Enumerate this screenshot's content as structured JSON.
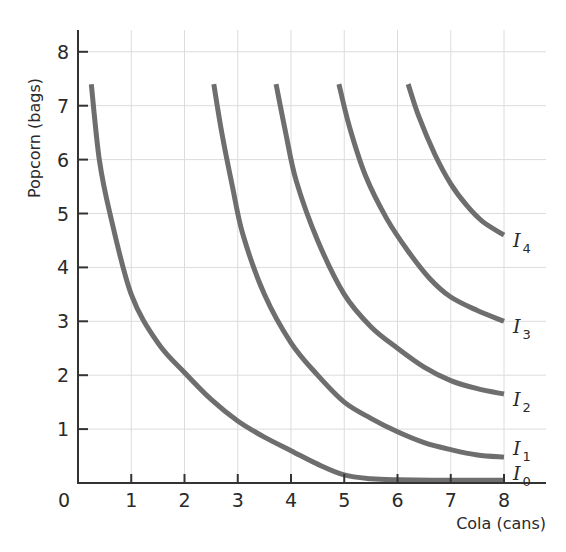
{
  "chart_data": {
    "type": "line",
    "title": "",
    "xlabel": "Cola (cans)",
    "ylabel": "Popcorn (bags)",
    "xlim": [
      0,
      8
    ],
    "ylim": [
      0,
      8
    ],
    "xticks": [
      "0",
      "1",
      "2",
      "3",
      "4",
      "5",
      "6",
      "7",
      "8"
    ],
    "yticks": [
      "1",
      "2",
      "3",
      "4",
      "5",
      "6",
      "7",
      "8"
    ],
    "grid": true,
    "legend": "inline labels at right end of each curve",
    "color": "#6e6e6e",
    "series": [
      {
        "name": "I0",
        "label_main": "I",
        "label_sub": "0",
        "points": [
          [
            0.25,
            7.4
          ],
          [
            0.4,
            6.0
          ],
          [
            0.6,
            5.0
          ],
          [
            1.0,
            3.5
          ],
          [
            1.5,
            2.6
          ],
          [
            2.0,
            2.05
          ],
          [
            2.5,
            1.55
          ],
          [
            3.0,
            1.15
          ],
          [
            3.5,
            0.85
          ],
          [
            4.0,
            0.6
          ],
          [
            4.5,
            0.35
          ],
          [
            5.0,
            0.15
          ],
          [
            5.5,
            0.08
          ],
          [
            6.0,
            0.06
          ],
          [
            7.0,
            0.05
          ],
          [
            8.0,
            0.05
          ]
        ]
      },
      {
        "name": "I1",
        "label_main": "I",
        "label_sub": "1",
        "points": [
          [
            2.55,
            7.4
          ],
          [
            2.7,
            6.5
          ],
          [
            2.9,
            5.5
          ],
          [
            3.1,
            4.6
          ],
          [
            3.5,
            3.5
          ],
          [
            4.0,
            2.6
          ],
          [
            4.5,
            2.0
          ],
          [
            5.0,
            1.5
          ],
          [
            5.5,
            1.2
          ],
          [
            6.0,
            0.95
          ],
          [
            6.5,
            0.75
          ],
          [
            7.0,
            0.62
          ],
          [
            7.5,
            0.52
          ],
          [
            8.0,
            0.48
          ]
        ]
      },
      {
        "name": "I2",
        "label_main": "I",
        "label_sub": "2",
        "points": [
          [
            3.72,
            7.4
          ],
          [
            3.9,
            6.5
          ],
          [
            4.1,
            5.6
          ],
          [
            4.5,
            4.5
          ],
          [
            5.0,
            3.5
          ],
          [
            5.5,
            2.9
          ],
          [
            6.0,
            2.5
          ],
          [
            6.5,
            2.15
          ],
          [
            7.0,
            1.9
          ],
          [
            7.5,
            1.75
          ],
          [
            8.0,
            1.65
          ]
        ]
      },
      {
        "name": "I3",
        "label_main": "I",
        "label_sub": "3",
        "points": [
          [
            4.9,
            7.4
          ],
          [
            5.1,
            6.6
          ],
          [
            5.4,
            5.7
          ],
          [
            5.8,
            4.9
          ],
          [
            6.2,
            4.3
          ],
          [
            6.6,
            3.8
          ],
          [
            7.0,
            3.45
          ],
          [
            7.5,
            3.2
          ],
          [
            8.0,
            3.0
          ]
        ]
      },
      {
        "name": "I4",
        "label_main": "I",
        "label_sub": "4",
        "points": [
          [
            6.2,
            7.4
          ],
          [
            6.4,
            6.8
          ],
          [
            6.7,
            6.1
          ],
          [
            7.0,
            5.55
          ],
          [
            7.3,
            5.15
          ],
          [
            7.6,
            4.85
          ],
          [
            8.0,
            4.6
          ]
        ]
      }
    ]
  }
}
